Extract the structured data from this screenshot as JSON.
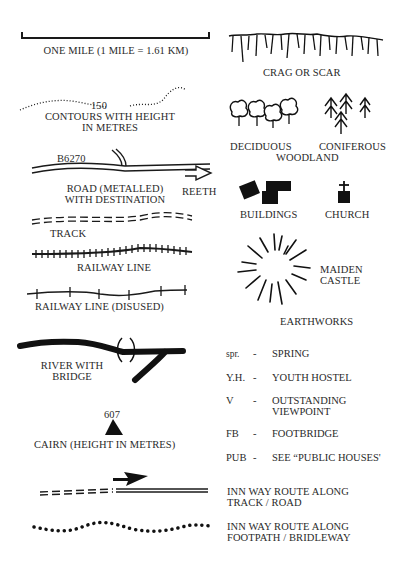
{
  "legend": {
    "scale": {
      "label": "ONE MILE (1 MILE = 1.61 KM)"
    },
    "contours": {
      "label_line1": "CONTOURS WITH HEIGHT",
      "label_line2": "IN METRES",
      "height_value": "150"
    },
    "road": {
      "road_number": "B6270",
      "label_line1": "ROAD (METALLED)",
      "label_line2": "WITH DESTINATION",
      "destination": "REETH"
    },
    "track": {
      "label": "TRACK"
    },
    "railway": {
      "label": "RAILWAY LINE"
    },
    "railway_disused": {
      "label": "RAILWAY LINE (DISUSED)"
    },
    "river": {
      "label_line1": "RIVER WITH",
      "label_line2": "BRIDGE"
    },
    "cairn": {
      "height_value": "607",
      "label": "CAIRN (HEIGHT IN METRES)"
    },
    "crag": {
      "label": "CRAG OR SCAR"
    },
    "woodland": {
      "deciduous": "DECIDUOUS",
      "coniferous": "CONIFEROUS",
      "woodland": "WOODLAND"
    },
    "buildings": {
      "label": "BUILDINGS"
    },
    "church": {
      "label": "CHURCH"
    },
    "earthworks": {
      "name_line1": "MAIDEN",
      "name_line2": "CASTLE",
      "label": "EARTHWORKS"
    },
    "abbreviations": [
      {
        "abbr": "spr.",
        "dash": "-",
        "meaning": "SPRING",
        "meaning2": ""
      },
      {
        "abbr": "Y.H.",
        "dash": "-",
        "meaning": "YOUTH HOSTEL",
        "meaning2": ""
      },
      {
        "abbr": "V",
        "dash": "-",
        "meaning": "OUTSTANDING",
        "meaning2": "VIEWPOINT"
      },
      {
        "abbr": "FB",
        "dash": "-",
        "meaning": "FOOTBRIDGE",
        "meaning2": ""
      },
      {
        "abbr": "PUB",
        "dash": "-",
        "meaning": "SEE “PUBLIC HOUSES'",
        "meaning2": ""
      }
    ],
    "inn_way_track": {
      "line1": "INN WAY ROUTE ALONG",
      "line2": "TRACK / ROAD"
    },
    "inn_way_footpath": {
      "line1": "INN WAY ROUTE ALONG",
      "line2": "FOOTPATH / BRIDLEWAY"
    }
  }
}
